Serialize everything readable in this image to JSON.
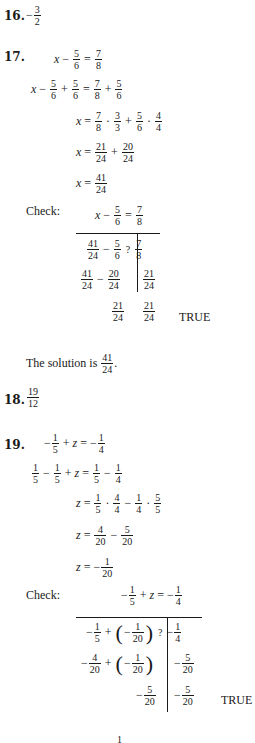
{
  "problems": {
    "p16": {
      "number": "16.",
      "sign": "−",
      "answer": {
        "num": "3",
        "den": "2"
      }
    },
    "p17": {
      "number": "17.",
      "steps": [
        {
          "lhs": "x − 5/6",
          "rhs": "7/8"
        },
        {
          "lhs": "x − 5/6 + 5/6",
          "rhs": "7/8 + 5/6"
        },
        {
          "lhs": "x",
          "rhs": "7/8 · 3/3 + 5/6 · 4/4"
        },
        {
          "lhs": "x",
          "rhs": "21/24 + 20/24"
        },
        {
          "lhs": "x",
          "rhs": "41/24"
        }
      ],
      "frac": {
        "n5": "5",
        "d6": "6",
        "n7": "7",
        "d8": "8",
        "n3": "3",
        "d3": "3",
        "n4": "4",
        "d4": "4",
        "n21": "21",
        "n20": "20",
        "d24": "24",
        "n41": "41"
      },
      "var": "x",
      "check_label": "Check:",
      "check": {
        "header": "x − 5/6 = 7/8",
        "rows": [
          {
            "left": "41/24 − 5/6",
            "mid": "?",
            "right": "7/8"
          },
          {
            "left": "41/24 − 20/24",
            "right": "21/24"
          },
          {
            "left": "21/24",
            "right": "21/24",
            "verdict": "TRUE"
          }
        ]
      },
      "solution_text": "The solution is",
      "solution": {
        "num": "41",
        "den": "24"
      },
      "period": "."
    },
    "p18": {
      "number": "18.",
      "answer": {
        "num": "19",
        "den": "12"
      }
    },
    "p19": {
      "number": "19.",
      "var": "z",
      "steps": [
        {
          "lhs": "−1/5 + z",
          "rhs": "−1/4"
        },
        {
          "lhs": "1/5 − 1/5 + z",
          "rhs": "1/5 − 1/4"
        },
        {
          "lhs": "z",
          "rhs": "1/5 · 4/4 − 1/4 · 5/5"
        },
        {
          "lhs": "z",
          "rhs": "4/20 − 5/20"
        },
        {
          "lhs": "z",
          "rhs": "−1/20"
        }
      ],
      "frac": {
        "n1": "1",
        "d5": "5",
        "d4": "4",
        "n4": "4",
        "n5": "5",
        "d20": "20"
      },
      "check_label": "Check:",
      "check": {
        "header": "−1/5 + z = −1/4",
        "rows": [
          {
            "left": "−1/5 + (−1/20)",
            "mid": "?",
            "right": "−1/4"
          },
          {
            "left": "−4/20 + (−1/20)",
            "right": "−5/20"
          },
          {
            "left": "−5/20",
            "right": "−5/20",
            "verdict": "TRUE"
          }
        ]
      },
      "partial_next": "1"
    }
  },
  "symbols": {
    "minus": "−",
    "plus": "+",
    "eq": "=",
    "dot": "·",
    "lparen": "(",
    "rparen": ")",
    "q": "?",
    "verdict": "TRUE"
  }
}
